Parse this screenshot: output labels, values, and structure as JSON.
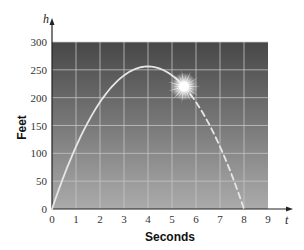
{
  "chart_data": {
    "type": "line",
    "title": "",
    "xlabel": "Seconds",
    "ylabel": "Feet",
    "x_axis_variable": "t",
    "y_axis_variable": "h",
    "xlim": [
      0,
      9
    ],
    "ylim": [
      0,
      300
    ],
    "x_ticks": [
      0,
      1,
      2,
      3,
      4,
      5,
      6,
      7,
      8,
      9
    ],
    "y_ticks": [
      0,
      50,
      100,
      150,
      200,
      250,
      300
    ],
    "grid": true,
    "legend": null,
    "series": [
      {
        "name": "height (solid, before burst)",
        "style": "solid",
        "x": [
          0,
          0.5,
          1,
          1.5,
          2,
          2.5,
          3,
          3.5,
          4,
          4.5,
          5,
          5.5
        ],
        "values": [
          0,
          60,
          112,
          156,
          192,
          220,
          240,
          252,
          256,
          252,
          240,
          220
        ]
      },
      {
        "name": "height (dashed, after burst)",
        "style": "dashed",
        "x": [
          5.5,
          6,
          6.5,
          7,
          7.5,
          8
        ],
        "values": [
          220,
          192,
          156,
          112,
          60,
          0
        ]
      }
    ],
    "annotations": [
      {
        "type": "burst",
        "x": 5.5,
        "y": 220,
        "description": "starburst explosion marker"
      }
    ],
    "colors": {
      "plot_top": "#4a4a4a",
      "plot_bottom": "#a8a8a8",
      "grid": "#c8c8c8",
      "curve": "#e6e6e6"
    }
  }
}
